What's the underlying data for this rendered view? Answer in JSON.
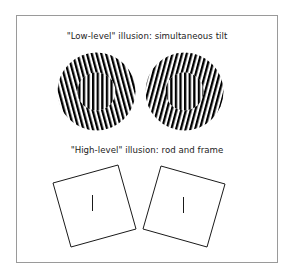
{
  "figure": {
    "frame_color": "#9a9a9a",
    "panels": [
      {
        "title": "\"Low-level\" illusion: simultaneous tilt",
        "type": "simultaneous-tilt",
        "stimuli": [
          {
            "name": "left-grating",
            "center": [
              96.5,
              91.5
            ],
            "outer_radius": 39,
            "inner_radius": 19,
            "surround_tilt_deg": -15,
            "center_tilt_deg": 0
          },
          {
            "name": "right-grating",
            "center": [
              184.5,
              91.5
            ],
            "outer_radius": 39,
            "inner_radius": 19,
            "surround_tilt_deg": 15,
            "center_tilt_deg": 0
          }
        ]
      },
      {
        "title": "\"High-level\" illusion: rod and frame",
        "type": "rod-and-frame",
        "stimuli": [
          {
            "name": "left-frame",
            "frame_tilt_deg": -16,
            "rod": "vertical"
          },
          {
            "name": "right-frame",
            "frame_tilt_deg": 16,
            "rod": "vertical"
          }
        ]
      }
    ],
    "colors": {
      "stripe": "#000000",
      "background": "#ffffff",
      "text": "#222222",
      "line": "#1a1a1a"
    }
  }
}
